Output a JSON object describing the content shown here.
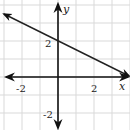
{
  "chart_data": {
    "type": "line",
    "title": "",
    "xlabel": "x",
    "ylabel": "y",
    "xlim": [
      -3.2,
      4
    ],
    "ylim": [
      -3,
      4
    ],
    "grid": true,
    "grid_step": 1,
    "x_tick_labels": [
      {
        "value": -2,
        "label": "-2"
      },
      {
        "value": 2,
        "label": "2"
      }
    ],
    "y_tick_labels": [
      {
        "value": 2,
        "label": "2"
      },
      {
        "value": -2,
        "label": "-2"
      }
    ],
    "series": [
      {
        "name": "line",
        "equation": "y = -0.5x + 2",
        "x": [
          -3,
          0,
          4
        ],
        "y": [
          3.5,
          2,
          0
        ],
        "arrows_both_ends": true
      }
    ],
    "colors": {
      "axis": "#111111",
      "grid": "#d9d9d9",
      "line": "#222222"
    }
  },
  "labels": {
    "x_axis": "x",
    "y_axis": "y",
    "x_neg2": "-2",
    "x_pos2": "2",
    "y_pos2": "2",
    "y_neg2": "-2"
  }
}
